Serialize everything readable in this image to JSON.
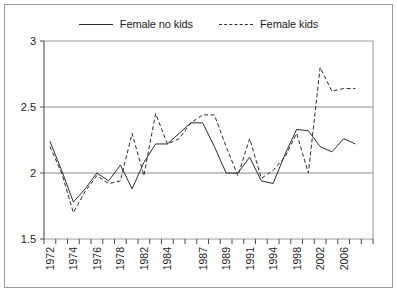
{
  "legend": {
    "position": "top-center",
    "entries": [
      {
        "label": "Female no kids",
        "style": "solid"
      },
      {
        "label": "Female kids",
        "style": "dashed"
      }
    ]
  },
  "axes": {
    "y_ticks": [
      "3",
      "2.5",
      "2",
      "1.5"
    ],
    "y_tick_values": [
      3,
      2.5,
      2,
      1.5
    ],
    "x_tick_labels": [
      "1972",
      "1974",
      "1976",
      "1978",
      "1982",
      "1984",
      "1987",
      "1989",
      "1991",
      "1994",
      "1998",
      "2002",
      "2006"
    ]
  },
  "colors": {
    "line": "#2b2b2b",
    "grid": "#8c8c8c",
    "frame": "#9a9a9a",
    "background": "#ffffff"
  },
  "chart_data": {
    "type": "line",
    "title": "",
    "xlabel": "",
    "ylabel": "",
    "ylim": [
      1.5,
      3
    ],
    "grid": true,
    "legend_position": "top-center",
    "categories": [
      "1972",
      "1973",
      "1974",
      "1975",
      "1976",
      "1977",
      "1978",
      "1980",
      "1982",
      "1983",
      "1984",
      "1985",
      "1986",
      "1987",
      "1988",
      "1989",
      "1990",
      "1991",
      "1993",
      "1994",
      "1996",
      "1998",
      "2000",
      "2002",
      "2004",
      "2006",
      "2008"
    ],
    "tick_labels": [
      "1972",
      "",
      "1974",
      "",
      "1976",
      "",
      "1978",
      "",
      "1982",
      "",
      "1984",
      "",
      "",
      "1987",
      "",
      "1989",
      "",
      "1991",
      "",
      "1994",
      "",
      "1998",
      "",
      "2002",
      "",
      "2006",
      ""
    ],
    "series": [
      {
        "name": "Female no kids",
        "style": "solid",
        "values": [
          2.24,
          2.02,
          1.78,
          1.88,
          2.0,
          1.94,
          2.06,
          1.88,
          2.08,
          2.22,
          2.22,
          2.3,
          2.38,
          2.38,
          2.2,
          2.0,
          2.0,
          2.12,
          1.94,
          1.92,
          2.14,
          2.33,
          2.32,
          2.2,
          2.16,
          2.26,
          2.22
        ]
      },
      {
        "name": "Female kids",
        "style": "dashed",
        "values": [
          2.2,
          2.0,
          1.7,
          1.86,
          1.98,
          1.92,
          1.94,
          2.3,
          1.98,
          2.45,
          2.22,
          2.26,
          2.38,
          2.44,
          2.44,
          2.2,
          1.98,
          2.26,
          1.96,
          2.02,
          2.12,
          2.3,
          2.0,
          2.8,
          2.62,
          2.64,
          2.64
        ]
      }
    ]
  }
}
